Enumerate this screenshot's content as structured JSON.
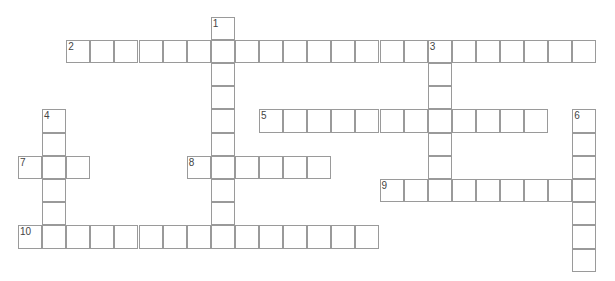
{
  "puzzle": {
    "grid": {
      "origin_x": 18,
      "origin_y": 16.6,
      "cell_w": 24.1,
      "cell_h": 23.2,
      "line_color": "#9a9a9a"
    },
    "words": [
      {
        "number": "1",
        "direction": "down",
        "row": 0,
        "col": 8,
        "length": 10
      },
      {
        "number": "2",
        "direction": "across",
        "row": 1,
        "col": 2,
        "length": 22
      },
      {
        "number": "3",
        "direction": "down",
        "row": 1,
        "col": 17,
        "length": 7
      },
      {
        "number": "4",
        "direction": "down",
        "row": 4,
        "col": 1,
        "length": 6
      },
      {
        "number": "5",
        "direction": "across",
        "row": 4,
        "col": 10,
        "length": 12
      },
      {
        "number": "6",
        "direction": "down",
        "row": 4,
        "col": 23,
        "length": 7
      },
      {
        "number": "7",
        "direction": "across",
        "row": 6,
        "col": 0,
        "length": 3
      },
      {
        "number": "8",
        "direction": "across",
        "row": 6,
        "col": 7,
        "length": 6
      },
      {
        "number": "9",
        "direction": "across",
        "row": 7,
        "col": 15,
        "length": 9
      },
      {
        "number": "10",
        "direction": "across",
        "row": 9,
        "col": 0,
        "length": 15
      }
    ]
  }
}
